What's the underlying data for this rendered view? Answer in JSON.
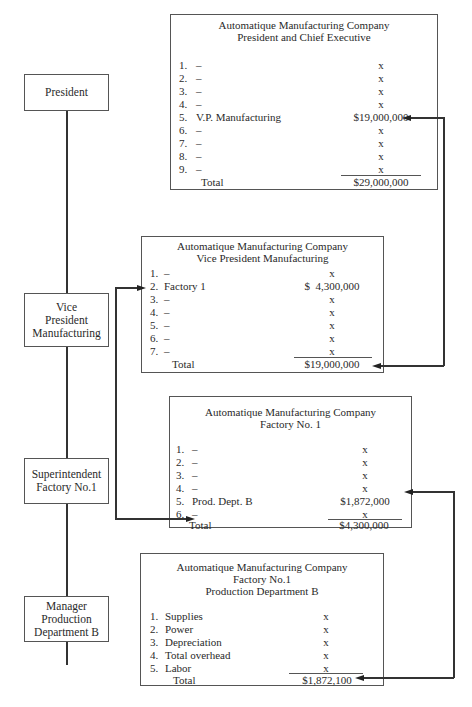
{
  "roles": [
    {
      "id": "president",
      "lines": [
        "President"
      ]
    },
    {
      "id": "vp",
      "lines": [
        "Vice",
        "President",
        "Manufacturing"
      ]
    },
    {
      "id": "superintendent",
      "lines": [
        "Superintendent",
        "Factory No.1"
      ]
    },
    {
      "id": "manager",
      "lines": [
        "Manager",
        "Production",
        "Department B"
      ]
    }
  ],
  "statements": {
    "president": {
      "header": [
        "Automatique Manufacturing Company",
        "President and Chief Executive"
      ],
      "rows": [
        {
          "num": "1.",
          "label": "–",
          "value": "x"
        },
        {
          "num": "2.",
          "label": "–",
          "value": "x"
        },
        {
          "num": "3.",
          "label": "–",
          "value": "x"
        },
        {
          "num": "4.",
          "label": "–",
          "value": "x"
        },
        {
          "num": "5.",
          "label": "V.P. Manufacturing",
          "value": "$19,000,000"
        },
        {
          "num": "6.",
          "label": "–",
          "value": "x"
        },
        {
          "num": "7.",
          "label": "–",
          "value": "x"
        },
        {
          "num": "8.",
          "label": "–",
          "value": "x"
        },
        {
          "num": "9.",
          "label": "–",
          "value": "x"
        }
      ],
      "total_label": "Total",
      "total_value": "$29,000,000"
    },
    "vp": {
      "header": [
        "Automatique Manufacturing Company",
        "Vice President Manufacturing"
      ],
      "rows": [
        {
          "num": "1.",
          "label": "–",
          "value": "x"
        },
        {
          "num": "2.",
          "label": "Factory 1",
          "value": "$  4,300,000"
        },
        {
          "num": "3.",
          "label": "–",
          "value": "x"
        },
        {
          "num": "4.",
          "label": "–",
          "value": "x"
        },
        {
          "num": "5.",
          "label": "–",
          "value": "x"
        },
        {
          "num": "6.",
          "label": "–",
          "value": "x"
        },
        {
          "num": "7.",
          "label": "–",
          "value": "x"
        }
      ],
      "total_label": "Total",
      "total_value": "$19,000,000"
    },
    "factory": {
      "header": [
        "Automatique Manufacturing Company",
        "Factory No. 1"
      ],
      "rows": [
        {
          "num": "1.",
          "label": "–",
          "value": "x"
        },
        {
          "num": "2.",
          "label": "–",
          "value": "x"
        },
        {
          "num": "3.",
          "label": "–",
          "value": "x"
        },
        {
          "num": "4.",
          "label": "–",
          "value": "x"
        },
        {
          "num": "5.",
          "label": "Prod. Dept. B",
          "value": "$1,872,000"
        },
        {
          "num": "6.",
          "label": "–",
          "value": "x"
        }
      ],
      "total_label": "Total",
      "total_value": "$4,300,000"
    },
    "dept": {
      "header": [
        "Automatique Manufacturing Company",
        "Factory No.1",
        "Production Department B"
      ],
      "rows": [
        {
          "num": "1.",
          "label": "Supplies",
          "value": "x"
        },
        {
          "num": "2.",
          "label": "Power",
          "value": "x"
        },
        {
          "num": "3.",
          "label": "Depreciation",
          "value": "x"
        },
        {
          "num": "4.",
          "label": "Total overhead",
          "value": "x"
        },
        {
          "num": "5.",
          "label": "Labor",
          "value": "x"
        }
      ],
      "total_label": "Total",
      "total_value": "$1,872,100"
    }
  }
}
